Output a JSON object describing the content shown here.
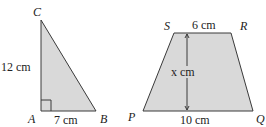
{
  "triangle": {
    "vertices": {
      "A": "A",
      "B": "B",
      "C": "C"
    },
    "side_ac": "12 cm",
    "side_ab": "7 cm",
    "right_angle_at": "A"
  },
  "trapezoid": {
    "vertices": {
      "P": "P",
      "Q": "Q",
      "R": "R",
      "S": "S"
    },
    "top_sr": "6 cm",
    "bottom_pq": "10 cm",
    "height": "x cm"
  },
  "colors": {
    "fill": "#d9d9d9",
    "stroke": "#3a3a3a"
  }
}
